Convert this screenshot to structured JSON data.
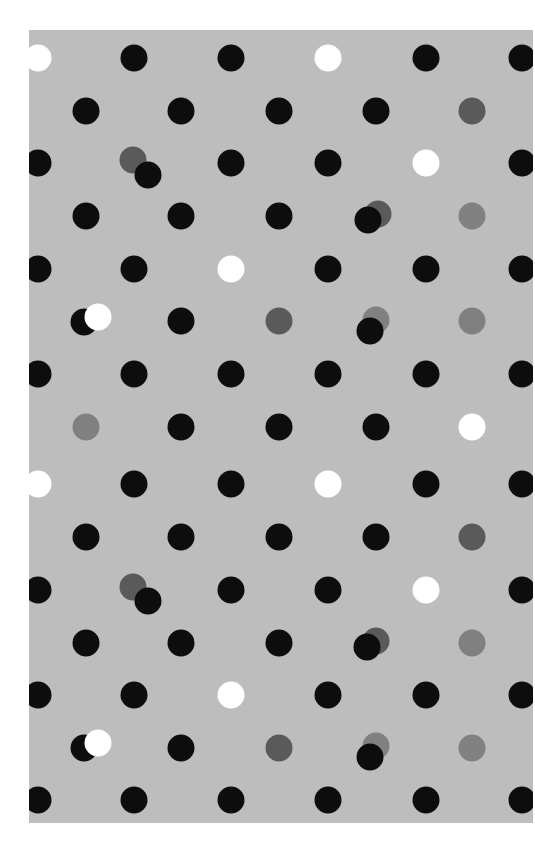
{
  "board": {
    "background": "#bdbdbd",
    "offset": {
      "x": 29,
      "y": 30
    },
    "dot_diameter": 27
  },
  "colors": {
    "black": "#0d0d0d",
    "white": "#ffffff",
    "darkgray": "#5a5a5a",
    "gray": "#808080"
  },
  "dots": [
    {
      "x": 38,
      "y": 58,
      "c": "white"
    },
    {
      "x": 134,
      "y": 58,
      "c": "black"
    },
    {
      "x": 231,
      "y": 58,
      "c": "black"
    },
    {
      "x": 328,
      "y": 58,
      "c": "white"
    },
    {
      "x": 426,
      "y": 58,
      "c": "black"
    },
    {
      "x": 522,
      "y": 58,
      "c": "black"
    },
    {
      "x": 86,
      "y": 111,
      "c": "black"
    },
    {
      "x": 181,
      "y": 111,
      "c": "black"
    },
    {
      "x": 279,
      "y": 111,
      "c": "black"
    },
    {
      "x": 376,
      "y": 111,
      "c": "black"
    },
    {
      "x": 472,
      "y": 111,
      "c": "darkgray"
    },
    {
      "x": 38,
      "y": 163,
      "c": "black"
    },
    {
      "x": 133,
      "y": 160,
      "c": "darkgray"
    },
    {
      "x": 148,
      "y": 175,
      "c": "black"
    },
    {
      "x": 231,
      "y": 163,
      "c": "black"
    },
    {
      "x": 328,
      "y": 163,
      "c": "black"
    },
    {
      "x": 426,
      "y": 163,
      "c": "white"
    },
    {
      "x": 522,
      "y": 163,
      "c": "black"
    },
    {
      "x": 86,
      "y": 216,
      "c": "black"
    },
    {
      "x": 181,
      "y": 216,
      "c": "black"
    },
    {
      "x": 279,
      "y": 216,
      "c": "black"
    },
    {
      "x": 378,
      "y": 214,
      "c": "darkgray"
    },
    {
      "x": 368,
      "y": 220,
      "c": "black"
    },
    {
      "x": 472,
      "y": 216,
      "c": "gray"
    },
    {
      "x": 38,
      "y": 269,
      "c": "black"
    },
    {
      "x": 134,
      "y": 269,
      "c": "black"
    },
    {
      "x": 231,
      "y": 269,
      "c": "white"
    },
    {
      "x": 328,
      "y": 269,
      "c": "black"
    },
    {
      "x": 426,
      "y": 269,
      "c": "black"
    },
    {
      "x": 522,
      "y": 269,
      "c": "black"
    },
    {
      "x": 84,
      "y": 322,
      "c": "black"
    },
    {
      "x": 98,
      "y": 317,
      "c": "white"
    },
    {
      "x": 181,
      "y": 321,
      "c": "black"
    },
    {
      "x": 279,
      "y": 321,
      "c": "darkgray"
    },
    {
      "x": 376,
      "y": 320,
      "c": "gray"
    },
    {
      "x": 370,
      "y": 331,
      "c": "black"
    },
    {
      "x": 472,
      "y": 321,
      "c": "gray"
    },
    {
      "x": 38,
      "y": 374,
      "c": "black"
    },
    {
      "x": 134,
      "y": 374,
      "c": "black"
    },
    {
      "x": 231,
      "y": 374,
      "c": "black"
    },
    {
      "x": 328,
      "y": 374,
      "c": "black"
    },
    {
      "x": 426,
      "y": 374,
      "c": "black"
    },
    {
      "x": 522,
      "y": 374,
      "c": "black"
    },
    {
      "x": 86,
      "y": 427,
      "c": "gray"
    },
    {
      "x": 181,
      "y": 427,
      "c": "black"
    },
    {
      "x": 279,
      "y": 427,
      "c": "black"
    },
    {
      "x": 376,
      "y": 427,
      "c": "black"
    },
    {
      "x": 472,
      "y": 427,
      "c": "white"
    },
    {
      "x": 38,
      "y": 484,
      "c": "white"
    },
    {
      "x": 134,
      "y": 484,
      "c": "black"
    },
    {
      "x": 231,
      "y": 484,
      "c": "black"
    },
    {
      "x": 328,
      "y": 484,
      "c": "white"
    },
    {
      "x": 426,
      "y": 484,
      "c": "black"
    },
    {
      "x": 522,
      "y": 484,
      "c": "black"
    },
    {
      "x": 86,
      "y": 537,
      "c": "black"
    },
    {
      "x": 181,
      "y": 537,
      "c": "black"
    },
    {
      "x": 279,
      "y": 537,
      "c": "black"
    },
    {
      "x": 376,
      "y": 537,
      "c": "black"
    },
    {
      "x": 472,
      "y": 537,
      "c": "darkgray"
    },
    {
      "x": 38,
      "y": 590,
      "c": "black"
    },
    {
      "x": 133,
      "y": 587,
      "c": "darkgray"
    },
    {
      "x": 148,
      "y": 601,
      "c": "black"
    },
    {
      "x": 231,
      "y": 590,
      "c": "black"
    },
    {
      "x": 328,
      "y": 590,
      "c": "black"
    },
    {
      "x": 426,
      "y": 590,
      "c": "white"
    },
    {
      "x": 522,
      "y": 590,
      "c": "black"
    },
    {
      "x": 86,
      "y": 643,
      "c": "black"
    },
    {
      "x": 181,
      "y": 643,
      "c": "black"
    },
    {
      "x": 279,
      "y": 643,
      "c": "black"
    },
    {
      "x": 376,
      "y": 641,
      "c": "darkgray"
    },
    {
      "x": 367,
      "y": 647,
      "c": "black"
    },
    {
      "x": 472,
      "y": 643,
      "c": "gray"
    },
    {
      "x": 38,
      "y": 695,
      "c": "black"
    },
    {
      "x": 134,
      "y": 695,
      "c": "black"
    },
    {
      "x": 231,
      "y": 695,
      "c": "white"
    },
    {
      "x": 328,
      "y": 695,
      "c": "black"
    },
    {
      "x": 426,
      "y": 695,
      "c": "black"
    },
    {
      "x": 522,
      "y": 695,
      "c": "black"
    },
    {
      "x": 84,
      "y": 748,
      "c": "black"
    },
    {
      "x": 98,
      "y": 743,
      "c": "white"
    },
    {
      "x": 181,
      "y": 748,
      "c": "black"
    },
    {
      "x": 279,
      "y": 748,
      "c": "darkgray"
    },
    {
      "x": 376,
      "y": 746,
      "c": "gray"
    },
    {
      "x": 370,
      "y": 757,
      "c": "black"
    },
    {
      "x": 472,
      "y": 748,
      "c": "gray"
    },
    {
      "x": 38,
      "y": 800,
      "c": "black"
    },
    {
      "x": 134,
      "y": 800,
      "c": "black"
    },
    {
      "x": 231,
      "y": 800,
      "c": "black"
    },
    {
      "x": 328,
      "y": 800,
      "c": "black"
    },
    {
      "x": 426,
      "y": 800,
      "c": "black"
    },
    {
      "x": 522,
      "y": 800,
      "c": "black"
    }
  ]
}
